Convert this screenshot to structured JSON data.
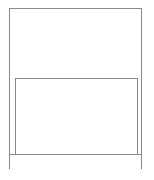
{
  "diagram": {
    "type": "wireframe",
    "colors": {
      "stroke": "#8a8a8a",
      "background": "#ffffff"
    },
    "regions": [
      {
        "id": "outer-frame",
        "label": ""
      },
      {
        "id": "top-area",
        "label": ""
      },
      {
        "id": "inner-panel",
        "label": ""
      },
      {
        "id": "footer-bar",
        "label": ""
      }
    ]
  }
}
